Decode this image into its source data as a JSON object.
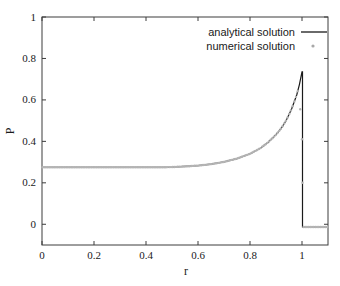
{
  "chart_data": {
    "type": "line",
    "title": "",
    "xlabel": "r",
    "ylabel": "P",
    "xlim": [
      0,
      1.1
    ],
    "ylim": [
      -0.1,
      1.0
    ],
    "grid": false,
    "legend_position": "top-right-inside",
    "x_ticks": [
      0,
      0.2,
      0.4,
      0.6,
      0.8,
      1
    ],
    "x_tick_labels": [
      "0",
      "0.2",
      "0.4",
      "0.6",
      "0.8",
      "1"
    ],
    "y_ticks": [
      0,
      0.2,
      0.4,
      0.6,
      0.8,
      1
    ],
    "y_tick_labels": [
      "0",
      "0.2",
      "0.4",
      "0.6",
      "0.8",
      "1"
    ],
    "colors": {
      "axis": "#3c3c3c",
      "analytical_line": "#1a1a1a",
      "numerical_dots": "#b4b4b4",
      "text": "#1a1a1a"
    },
    "legend": [
      {
        "label": "analytical solution",
        "sample": "line",
        "color": "#1a1a1a"
      },
      {
        "label": "numerical solution",
        "sample": "dot",
        "color": "#a8a8a8"
      }
    ],
    "series": [
      {
        "name": "analytical solution",
        "type": "line",
        "color": "#1a1a1a",
        "points": [
          [
            0.0,
            0.275
          ],
          [
            0.2,
            0.275
          ],
          [
            0.35,
            0.275
          ],
          [
            0.45,
            0.275
          ],
          [
            0.5,
            0.276
          ],
          [
            0.55,
            0.279
          ],
          [
            0.6,
            0.283
          ],
          [
            0.65,
            0.29
          ],
          [
            0.7,
            0.301
          ],
          [
            0.75,
            0.317
          ],
          [
            0.8,
            0.34
          ],
          [
            0.84,
            0.367
          ],
          [
            0.87,
            0.396
          ],
          [
            0.9,
            0.432
          ],
          [
            0.92,
            0.463
          ],
          [
            0.94,
            0.503
          ],
          [
            0.96,
            0.556
          ],
          [
            0.98,
            0.625
          ],
          [
            0.99,
            0.674
          ],
          [
            1.0,
            0.735
          ]
        ],
        "shock_x": 1.002,
        "post_shock_level": -0.013,
        "post_shock_end": 1.1
      },
      {
        "name": "numerical solution",
        "type": "scatter",
        "color": "#b4b4b4",
        "marker_step": 0.0065,
        "follow_analytical_to": 0.984,
        "shock_smear_points": [
          [
            0.993,
            0.555
          ],
          [
            1.0,
            0.41
          ],
          [
            1.002,
            0.2
          ]
        ],
        "post_shock": {
          "from": 1.006,
          "to": 1.1,
          "y": -0.013
        }
      }
    ]
  }
}
